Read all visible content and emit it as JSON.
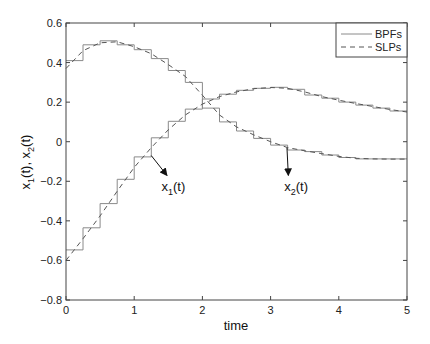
{
  "chart_data": {
    "type": "line",
    "title": "",
    "xlabel": "time",
    "ylabel_parts": [
      "x",
      "1",
      "(t),  x",
      "2",
      "(t)"
    ],
    "ylabel": "x1(t), x2(t)",
    "xlim": [
      0,
      5
    ],
    "ylim": [
      -0.8,
      0.6
    ],
    "xticks": [
      0,
      1,
      2,
      3,
      4,
      5
    ],
    "xtick_labels": [
      "0",
      "1",
      "2",
      "3",
      "4",
      "5"
    ],
    "yticks": [
      -0.8,
      -0.6,
      -0.4,
      -0.2,
      0,
      0.2,
      0.4,
      0.6
    ],
    "ytick_labels": [
      "−0.8",
      "−0.6",
      "−0.4",
      "−0.2",
      "0",
      "0.2",
      "0.4",
      "0.6"
    ],
    "grid": false,
    "legend": {
      "position": "upper right",
      "entries": [
        {
          "label": "BPFs",
          "style": "solid"
        },
        {
          "label": "SLPs",
          "style": "dashed"
        }
      ]
    },
    "step_width": 0.25,
    "series": [
      {
        "name": "x1(t) BPFs",
        "kind": "step",
        "style": "solid",
        "values": [
          -0.547,
          -0.435,
          -0.313,
          -0.19,
          -0.077,
          0.02,
          0.103,
          0.165,
          0.216,
          0.24,
          0.26,
          0.27,
          0.275,
          0.265,
          0.236,
          0.22,
          0.2,
          0.185,
          0.17,
          0.155
        ]
      },
      {
        "name": "x2(t) BPFs",
        "kind": "step",
        "style": "solid",
        "values": [
          0.41,
          0.49,
          0.51,
          0.49,
          0.465,
          0.42,
          0.36,
          0.3,
          0.17,
          0.1,
          0.054,
          0.017,
          -0.017,
          -0.042,
          -0.05,
          -0.067,
          -0.08,
          -0.087,
          -0.087,
          -0.087
        ]
      },
      {
        "name": "x1(t) SLPs",
        "kind": "line",
        "style": "dashed",
        "x": [
          0,
          0.25,
          0.5,
          0.75,
          1.0,
          1.25,
          1.5,
          1.75,
          2.0,
          2.25,
          2.5,
          2.75,
          3.0,
          3.25,
          3.5,
          3.75,
          4.0,
          4.25,
          4.5,
          4.75,
          5.0
        ],
        "values": [
          -0.6,
          -0.49,
          -0.375,
          -0.25,
          -0.13,
          -0.03,
          0.06,
          0.135,
          0.19,
          0.228,
          0.252,
          0.268,
          0.274,
          0.27,
          0.252,
          0.228,
          0.21,
          0.193,
          0.178,
          0.163,
          0.15
        ]
      },
      {
        "name": "x2(t) SLPs",
        "kind": "line",
        "style": "dashed",
        "x": [
          0,
          0.25,
          0.5,
          0.75,
          1.0,
          1.25,
          1.5,
          1.75,
          2.0,
          2.25,
          2.5,
          2.75,
          3.0,
          3.25,
          3.5,
          3.75,
          4.0,
          4.25,
          4.5,
          4.75,
          5.0
        ],
        "values": [
          0.37,
          0.46,
          0.5,
          0.505,
          0.48,
          0.445,
          0.39,
          0.33,
          0.235,
          0.135,
          0.075,
          0.035,
          0.0,
          -0.03,
          -0.046,
          -0.06,
          -0.074,
          -0.084,
          -0.087,
          -0.088,
          -0.088
        ]
      }
    ],
    "annotations": [
      {
        "label_base": "x",
        "label_sub": "1",
        "label_tail": "(t)",
        "label": "x1(t)",
        "arrow_from": [
          1.25,
          -0.07
        ],
        "arrow_to": [
          1.48,
          -0.17
        ],
        "text_at": [
          1.4,
          -0.25
        ]
      },
      {
        "label_base": "x",
        "label_sub": "2",
        "label_tail": "(t)",
        "label": "x2(t)",
        "arrow_from": [
          3.24,
          -0.03
        ],
        "arrow_to": [
          3.26,
          -0.17
        ],
        "text_at": [
          3.2,
          -0.25
        ]
      }
    ]
  },
  "colors": {
    "axes": "#444444",
    "step_line": "#8a8a8a",
    "dashed_line": "#555555",
    "text": "#111111",
    "arrow": "#111111"
  }
}
